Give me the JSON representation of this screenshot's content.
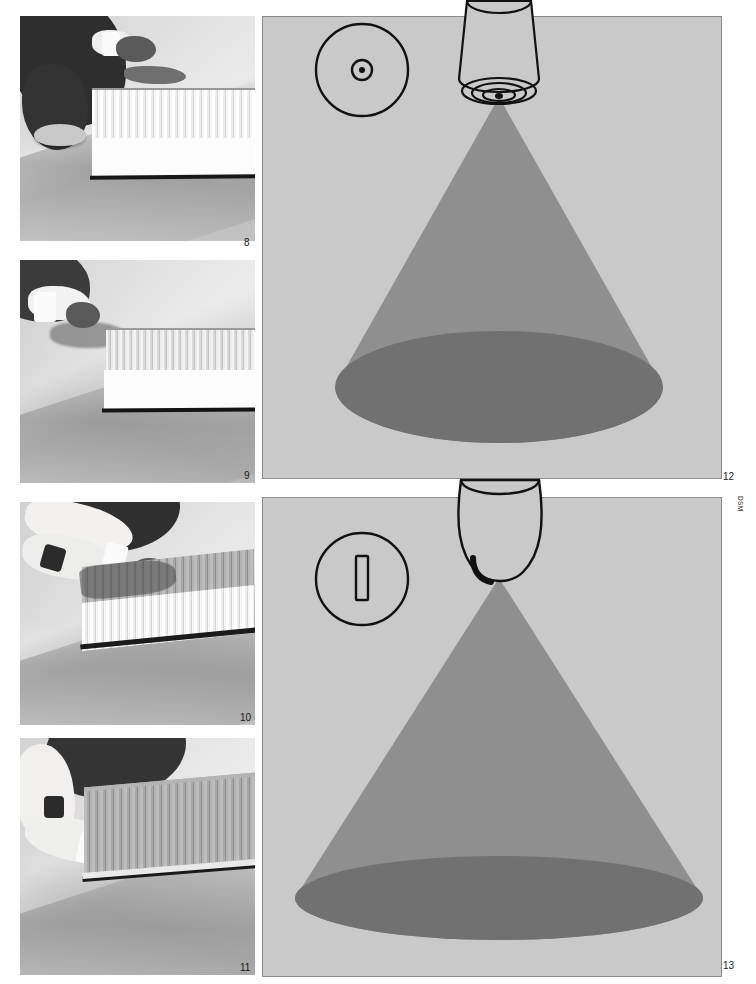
{
  "page": {
    "background": "#ffffff",
    "width": 756,
    "height": 984,
    "credit": "DSM"
  },
  "palette": {
    "diagram_background": "#c9c9c9",
    "diagram_border": "#8d8d8d",
    "spray_cone": "#8f8f8f",
    "spray_pool": "#6f6f6f",
    "ink": "#111111",
    "photo_mid": "#c9c9c9"
  },
  "figures": [
    {
      "number": "8",
      "kind": "photograph",
      "caption_number": "8",
      "alt": "Worker kneeling on floor positioning a white corrugated panel"
    },
    {
      "number": "9",
      "kind": "photograph",
      "caption_number": "9",
      "alt": "Gloved hand holding edge of white corrugated panel on floor"
    },
    {
      "number": "10",
      "kind": "photograph",
      "caption_number": "10",
      "alt": "Two arms working across a half-grey half-white corrugated panel"
    },
    {
      "number": "11",
      "kind": "photograph",
      "caption_number": "11",
      "alt": "Arm reaching to the lower edge of a finished grey corrugated panel"
    },
    {
      "number": "12",
      "kind": "diagram",
      "caption_number": "12",
      "nozzle_type": "round-orifice full cone nozzle",
      "inset_label": "round orifice with concentric swirl ring",
      "spray_pattern": "full cone",
      "spray_footprint": "circle"
    },
    {
      "number": "13",
      "kind": "diagram",
      "caption_number": "13",
      "nozzle_type": "slot orifice flat fan nozzle",
      "inset_label": "vertical rectangular slot orifice",
      "spray_pattern": "flat fan",
      "spray_footprint": "elongated ellipse"
    }
  ]
}
